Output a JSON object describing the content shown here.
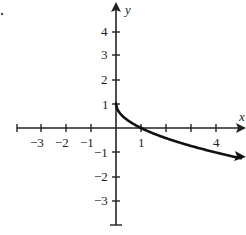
{
  "chart_data": {
    "type": "line",
    "title": "",
    "xlabel": "x",
    "ylabel": "y",
    "x_tick_labels": [
      "-3",
      "-2",
      "-1",
      "1",
      "4"
    ],
    "y_tick_labels": [
      "4",
      "3",
      "2",
      "1",
      "-1",
      "-2",
      "-3"
    ],
    "xlim": [
      -4,
      5
    ],
    "ylim": [
      -4,
      5
    ],
    "grid": false,
    "series": [
      {
        "name": "y = 1 - sqrt(x)",
        "x": [
          0,
          0.25,
          1,
          2,
          3,
          4,
          5
        ],
        "y": [
          1,
          0.5,
          0,
          -0.41,
          -0.73,
          -1,
          -1.24
        ]
      }
    ]
  },
  "labels": {
    "x_axis": "x",
    "y_axis": "y",
    "xt": {
      "m3": "−3",
      "m2": "−2",
      "m1": "−1",
      "p1": "1",
      "p4": "4"
    },
    "yt": {
      "p4": "4",
      "p3": "3",
      "p2": "2",
      "p1": "1",
      "m1": "−1",
      "m2": "−2",
      "m3": "−3"
    }
  },
  "colors": {
    "axis": "#222222",
    "curve": "#111111"
  }
}
